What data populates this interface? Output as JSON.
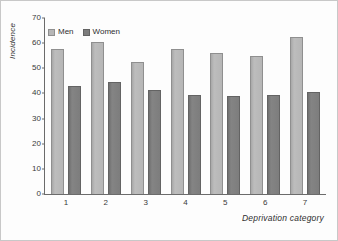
{
  "chart_data": {
    "type": "bar",
    "title": "",
    "xlabel": "Deprivation category",
    "ylabel": "Incidence",
    "categories": [
      "1",
      "2",
      "3",
      "4",
      "5",
      "6",
      "7"
    ],
    "series": [
      {
        "name": "Men",
        "values": [
          57.5,
          60.5,
          52.5,
          57.5,
          56.0,
          55.0,
          62.5
        ]
      },
      {
        "name": "Women",
        "values": [
          43.0,
          44.5,
          41.5,
          39.5,
          39.0,
          39.5,
          40.5
        ]
      }
    ],
    "ylim": [
      0,
      70
    ],
    "yticks": [
      0,
      10,
      20,
      30,
      40,
      50,
      60,
      70
    ],
    "ytick_labels": [
      "0",
      "10",
      "20",
      "30",
      "40",
      "50",
      "60",
      "70"
    ],
    "grid": false,
    "legend_position": "top-left",
    "colors": {
      "men": "#b6b6b6",
      "men_edge": "#8f8f8f",
      "women": "#7d7d7d",
      "women_edge": "#636363",
      "axis": "#6b6b6b",
      "text": "#2e2e2e",
      "frame": "#c8c8c8",
      "background": "#fdfdfd"
    }
  }
}
